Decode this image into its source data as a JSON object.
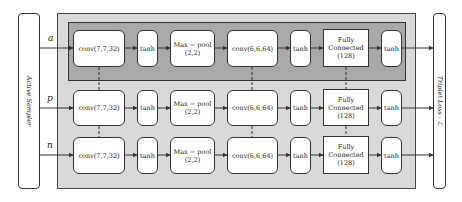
{
  "sampler": {
    "label": "Active Sampler"
  },
  "loss": {
    "label": "Triplet Loss - ℒ"
  },
  "branches": [
    {
      "input": "a",
      "nodes": [
        "conv(7,7,32)",
        "tanh",
        "Max − pool\n(2,2)",
        "conv(6,6,64)",
        "tanh",
        "Fully\nConnected\n(128)",
        "tanh"
      ]
    },
    {
      "input": "p",
      "nodes": [
        "conv(7,7,32)",
        "tanh",
        "Max − pool\n(2,2)",
        "conv(6,6,64)",
        "tanh",
        "Fully\nConnected\n(128)",
        "tanh"
      ]
    },
    {
      "input": "n",
      "nodes": [
        "conv(7,7,32)",
        "tanh",
        "Max − pool\n(2,2)",
        "conv(6,6,64)",
        "tanh",
        "Fully\nConnected\n(128)",
        "tanh"
      ]
    }
  ],
  "colors": {
    "outer_bg": "#d9d9d9",
    "inner_bg": "#a9a9a9",
    "line": "#333333"
  }
}
